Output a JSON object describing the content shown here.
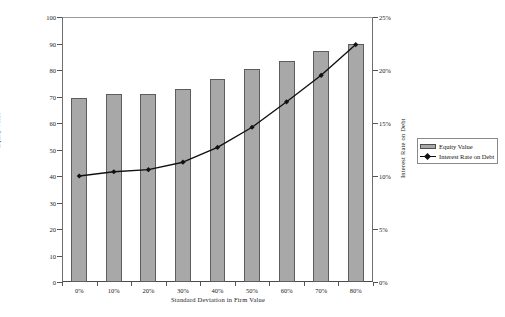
{
  "chart_data": {
    "type": "bar",
    "title": "",
    "subtitle": "",
    "xlabel": "Standard Deviation in Firm Value",
    "ylabel": "Equity Value",
    "y2label": "Interest Rate on Debt",
    "categories": [
      "0%",
      "10%",
      "20%",
      "30%",
      "40%",
      "50%",
      "60%",
      "70%",
      "80%"
    ],
    "ylim": [
      0,
      100
    ],
    "y2lim": [
      0,
      25
    ],
    "yticks": [
      "0",
      "10",
      "20",
      "30",
      "40",
      "50",
      "60",
      "70",
      "80",
      "90",
      "100"
    ],
    "ytick_values": [
      0,
      10,
      20,
      30,
      40,
      50,
      60,
      70,
      80,
      90,
      100
    ],
    "y2ticks": [
      "0%",
      "5%",
      "10%",
      "15%",
      "20%",
      "25%"
    ],
    "y2tick_values": [
      0,
      5,
      10,
      15,
      20,
      25
    ],
    "grid": false,
    "legend_position": "right",
    "series": [
      {
        "name": "Equity Value",
        "kind": "bar",
        "axis": "left",
        "color": "#a8a8a8",
        "edge_color": "#5d5d5d",
        "values": [
          69.5,
          71,
          71,
          73,
          76.5,
          80.5,
          83.5,
          87,
          90
        ]
      },
      {
        "name": "Interest Rate on Debt",
        "kind": "line",
        "axis": "right",
        "color": "#111111",
        "marker": "diamond",
        "values": [
          10.0,
          10.4,
          10.6,
          11.3,
          12.7,
          14.6,
          17.0,
          19.5,
          22.4
        ]
      }
    ]
  },
  "legend": {
    "items": [
      {
        "label": "Equity Value",
        "marker": "bar-swatch"
      },
      {
        "label": "Interest Rate on Debt",
        "marker": "line-diamond-swatch"
      }
    ]
  }
}
